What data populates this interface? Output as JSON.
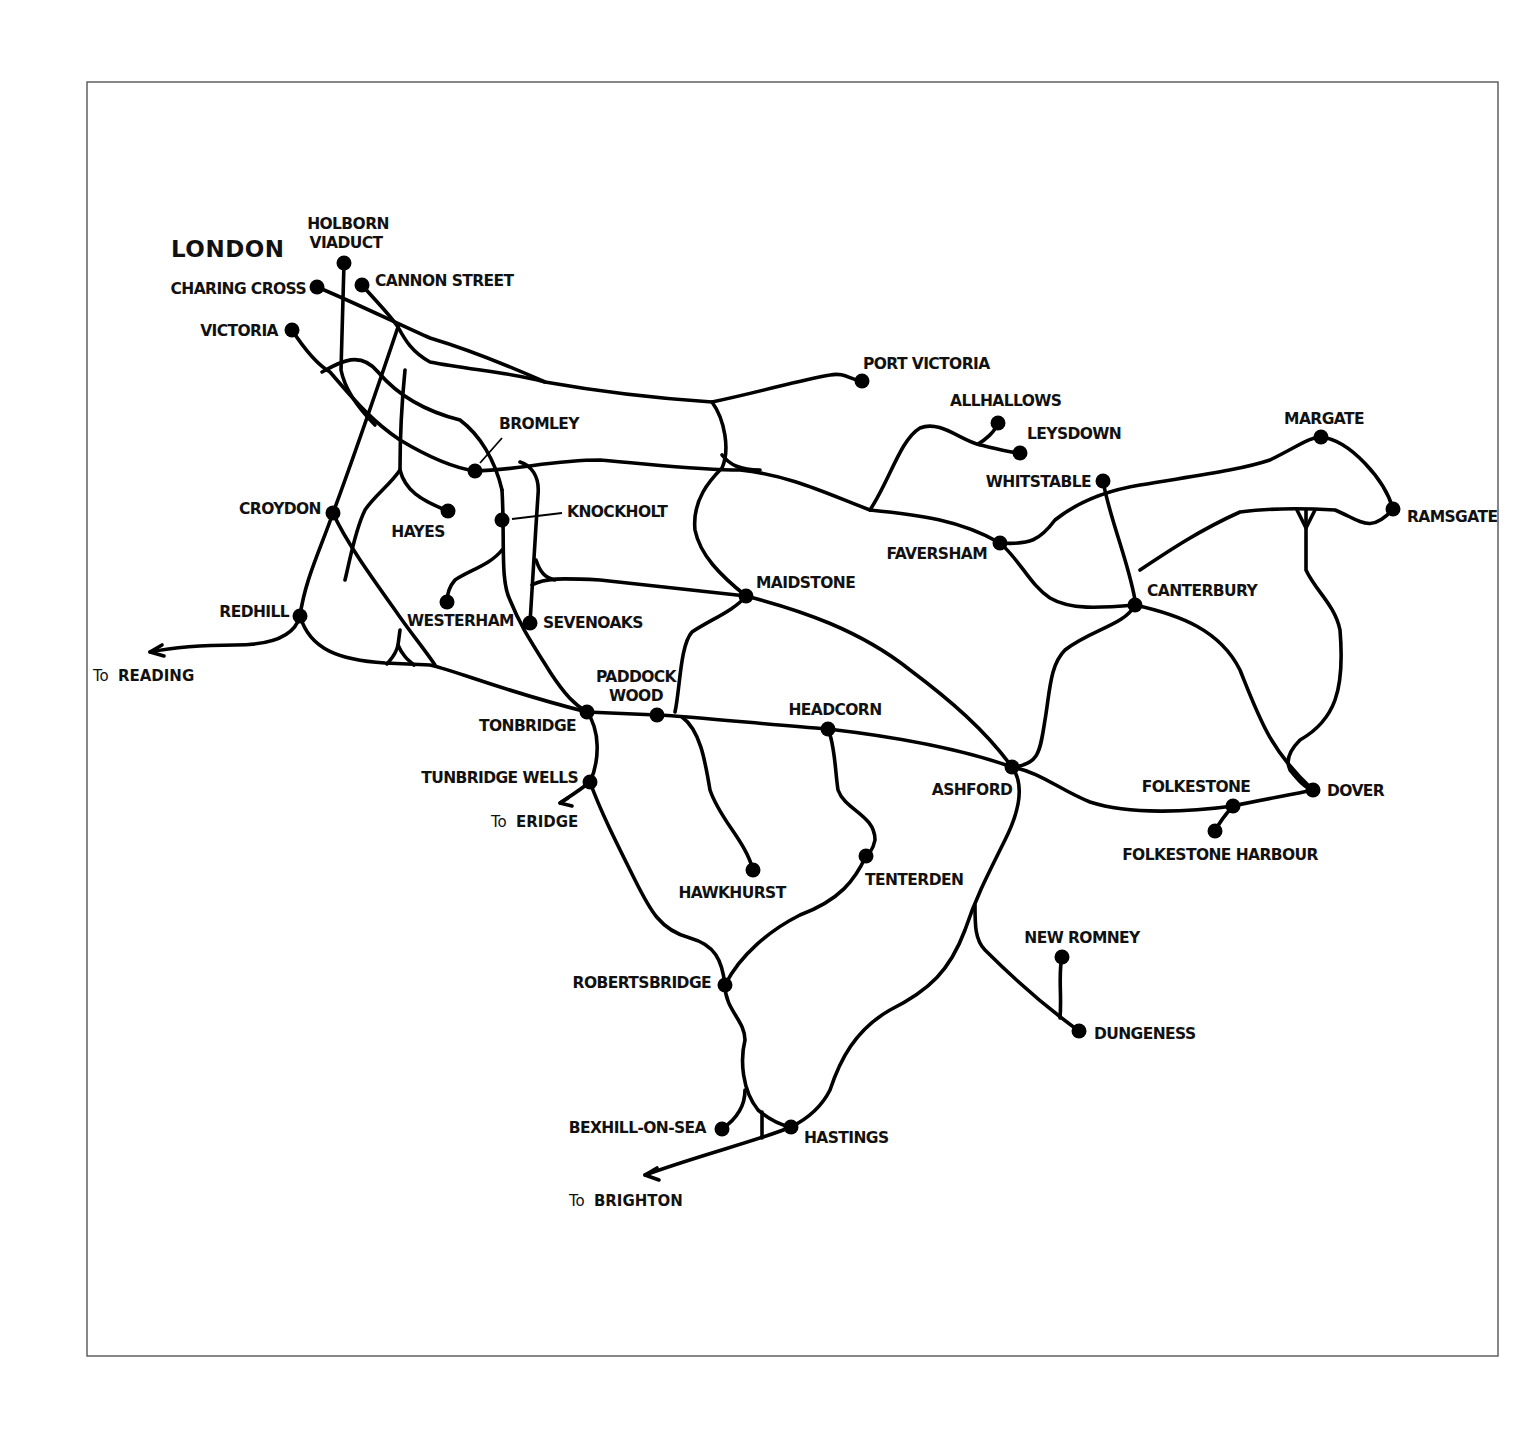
{
  "map": {
    "title": "LONDON",
    "frame": {
      "x": 87,
      "y": 82,
      "width": 1411,
      "height": 1274
    },
    "stations": [
      {
        "id": "holborn-viaduct",
        "name_line1": "HOLBORN",
        "name_line2": "VIADUCT",
        "x": 344,
        "y": 263
      },
      {
        "id": "cannon-street",
        "name": "CANNON STREET",
        "x": 362,
        "y": 285
      },
      {
        "id": "charing-cross",
        "name": "CHARING CROSS",
        "x": 317,
        "y": 287
      },
      {
        "id": "victoria",
        "name": "VICTORIA",
        "x": 292,
        "y": 330
      },
      {
        "id": "bromley",
        "name": "BROMLEY",
        "x": 475,
        "y": 471
      },
      {
        "id": "knockholt",
        "name": "KNOCKHOLT",
        "x": 502,
        "y": 520
      },
      {
        "id": "croydon",
        "name": "CROYDON",
        "x": 333,
        "y": 513
      },
      {
        "id": "hayes",
        "name": "HAYES",
        "x": 448,
        "y": 511
      },
      {
        "id": "redhill",
        "name": "REDHILL",
        "x": 300,
        "y": 616
      },
      {
        "id": "westerham",
        "name": "WESTERHAM",
        "x": 447,
        "y": 602
      },
      {
        "id": "sevenoaks",
        "name": "SEVENOAKS",
        "x": 530,
        "y": 623
      },
      {
        "id": "tonbridge",
        "name": "TONBRIDGE",
        "x": 587,
        "y": 712
      },
      {
        "id": "paddock-wood",
        "name_line1": "PADDOCK",
        "name_line2": "WOOD",
        "x": 657,
        "y": 715
      },
      {
        "id": "tunbridge-wells",
        "name": "TUNBRIDGE WELLS",
        "x": 590,
        "y": 782
      },
      {
        "id": "port-victoria",
        "name": "PORT VICTORIA",
        "x": 862,
        "y": 381
      },
      {
        "id": "allhallows",
        "name": "ALLHALLOWS",
        "x": 998,
        "y": 423
      },
      {
        "id": "leysdown",
        "name": "LEYSDOWN",
        "x": 1020,
        "y": 453
      },
      {
        "id": "whitstable",
        "name": "WHITSTABLE",
        "x": 1103,
        "y": 481
      },
      {
        "id": "margate",
        "name": "MARGATE",
        "x": 1321,
        "y": 437
      },
      {
        "id": "ramsgate",
        "name": "RAMSGATE",
        "x": 1393,
        "y": 509
      },
      {
        "id": "faversham",
        "name": "FAVERSHAM",
        "x": 1000,
        "y": 543
      },
      {
        "id": "canterbury",
        "name": "CANTERBURY",
        "x": 1135,
        "y": 605
      },
      {
        "id": "maidstone",
        "name": "MAIDSTONE",
        "x": 746,
        "y": 596
      },
      {
        "id": "headcorn",
        "name": "HEADCORN",
        "x": 828,
        "y": 729
      },
      {
        "id": "ashford",
        "name": "ASHFORD",
        "x": 1012,
        "y": 767
      },
      {
        "id": "folkestone",
        "name": "FOLKESTONE",
        "x": 1233,
        "y": 806
      },
      {
        "id": "folkestone-harbour",
        "name": "FOLKESTONE HARBOUR",
        "x": 1215,
        "y": 831
      },
      {
        "id": "dover",
        "name": "DOVER",
        "x": 1313,
        "y": 790
      },
      {
        "id": "hawkhurst",
        "name": "HAWKHURST",
        "x": 753,
        "y": 870
      },
      {
        "id": "tenterden",
        "name": "TENTERDEN",
        "x": 866,
        "y": 856
      },
      {
        "id": "new-romney",
        "name": "NEW ROMNEY",
        "x": 1062,
        "y": 957
      },
      {
        "id": "dungeness",
        "name": "DUNGENESS",
        "x": 1079,
        "y": 1031
      },
      {
        "id": "robertsbridge",
        "name": "ROBERTSBRIDGE",
        "x": 725,
        "y": 985
      },
      {
        "id": "bexhill-on-sea",
        "name": "BEXHILL-ON-SEA",
        "x": 722,
        "y": 1129
      },
      {
        "id": "hastings",
        "name": "HASTINGS",
        "x": 791,
        "y": 1127
      }
    ],
    "connections": [
      {
        "prefix": "To",
        "destination": "READING"
      },
      {
        "prefix": "To",
        "destination": "ERIDGE"
      },
      {
        "prefix": "To",
        "destination": "BRIGHTON"
      }
    ]
  }
}
